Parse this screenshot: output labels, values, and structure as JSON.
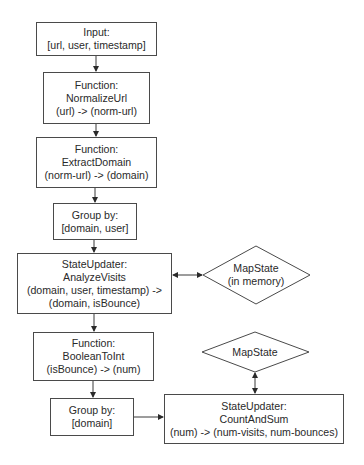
{
  "diagram": {
    "nodes": {
      "input": {
        "lines": [
          "Input:",
          "[url, user, timestamp]"
        ]
      },
      "normalize_url": {
        "lines": [
          "Function:",
          "NormalizeUrl",
          "(url) -> (norm-url)"
        ]
      },
      "extract_domain": {
        "lines": [
          "Function:",
          "ExtractDomain",
          "(norm-url) -> (domain)"
        ]
      },
      "group_domain_user": {
        "lines": [
          "Group by:",
          "[domain, user]"
        ]
      },
      "analyze_visits": {
        "lines": [
          "StateUpdater:",
          "AnalyzeVisits",
          "(domain, user, timestamp) ->",
          "(domain, isBounce)"
        ]
      },
      "mapstate_memory": {
        "lines": [
          "MapState",
          "(in memory)"
        ]
      },
      "boolean_to_int": {
        "lines": [
          "Function:",
          "BooleanToInt",
          "(isBounce) -> (num)"
        ]
      },
      "mapstate": {
        "lines": [
          "MapState"
        ]
      },
      "group_domain": {
        "lines": [
          "Group by:",
          "[domain]"
        ]
      },
      "count_and_sum": {
        "lines": [
          "StateUpdater:",
          "CountAndSum",
          "(num) -> (num-visits, num-bounces)"
        ]
      }
    },
    "edges": [
      {
        "from": "input",
        "to": "normalize_url",
        "type": "arrow"
      },
      {
        "from": "normalize_url",
        "to": "extract_domain",
        "type": "arrow"
      },
      {
        "from": "extract_domain",
        "to": "group_domain_user",
        "type": "arrow"
      },
      {
        "from": "group_domain_user",
        "to": "analyze_visits",
        "type": "arrow"
      },
      {
        "from": "analyze_visits",
        "to": "mapstate_memory",
        "type": "bidirectional"
      },
      {
        "from": "analyze_visits",
        "to": "boolean_to_int",
        "type": "arrow"
      },
      {
        "from": "boolean_to_int",
        "to": "group_domain",
        "type": "arrow"
      },
      {
        "from": "group_domain",
        "to": "count_and_sum",
        "type": "arrow"
      },
      {
        "from": "count_and_sum",
        "to": "mapstate",
        "type": "bidirectional"
      }
    ],
    "colors": {
      "stroke": "#3a3a3a",
      "text": "#2a2a2a",
      "background": "#ffffff"
    }
  }
}
